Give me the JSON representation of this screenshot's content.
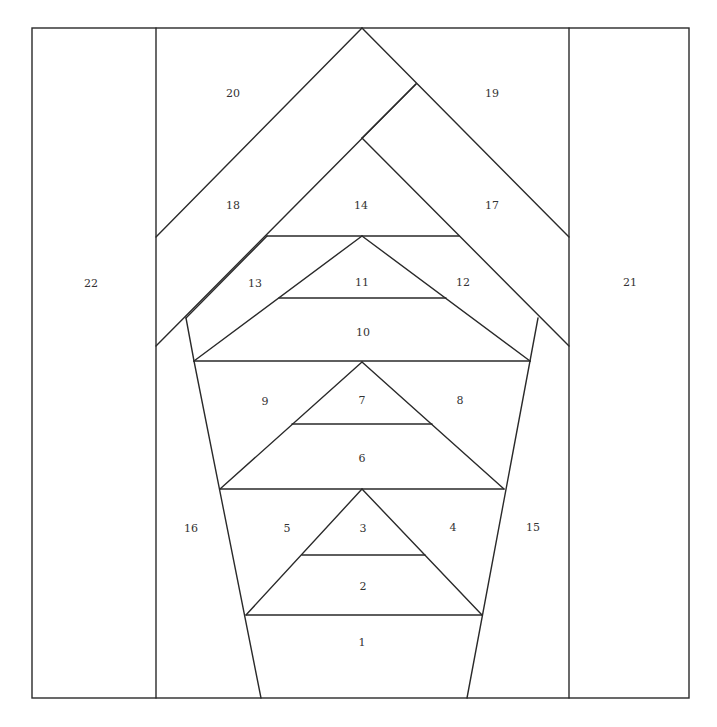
{
  "diagram": {
    "line_color": "#2a2a2a",
    "background": "#ffffff",
    "outer_border": {
      "x1": 32,
      "y1": 28,
      "x2": 689,
      "y2": 698
    },
    "segments": [
      [
        156,
        28,
        156,
        698
      ],
      [
        569,
        28,
        569,
        698
      ],
      [
        156,
        237,
        362,
        28
      ],
      [
        362,
        28,
        569,
        237
      ],
      [
        156,
        346,
        416,
        84
      ],
      [
        416,
        84,
        362,
        138
      ],
      [
        362,
        138,
        569,
        346
      ],
      [
        267,
        236,
        459,
        236
      ],
      [
        186,
        318,
        267,
        236
      ],
      [
        362,
        236,
        530,
        361
      ],
      [
        362,
        236,
        194,
        361
      ],
      [
        279,
        298,
        446,
        298
      ],
      [
        194,
        361,
        530,
        361
      ],
      [
        538,
        318,
        530,
        361
      ],
      [
        186,
        318,
        194,
        361
      ],
      [
        362,
        362,
        220,
        489
      ],
      [
        362,
        362,
        504,
        489
      ],
      [
        292,
        424,
        432,
        424
      ],
      [
        220,
        489,
        504,
        489
      ],
      [
        194,
        361,
        261,
        698
      ],
      [
        530,
        361,
        467,
        698
      ],
      [
        362,
        489,
        246,
        615
      ],
      [
        362,
        489,
        482,
        615
      ],
      [
        302,
        555,
        425,
        555
      ],
      [
        246,
        615,
        482,
        615
      ]
    ],
    "labels": [
      {
        "id": "1",
        "x": 362,
        "y": 643
      },
      {
        "id": "2",
        "x": 363,
        "y": 587
      },
      {
        "id": "3",
        "x": 363,
        "y": 529
      },
      {
        "id": "4",
        "x": 453,
        "y": 528
      },
      {
        "id": "5",
        "x": 287,
        "y": 529
      },
      {
        "id": "6",
        "x": 362,
        "y": 459
      },
      {
        "id": "7",
        "x": 362,
        "y": 401
      },
      {
        "id": "8",
        "x": 460,
        "y": 401
      },
      {
        "id": "9",
        "x": 265,
        "y": 402
      },
      {
        "id": "10",
        "x": 363,
        "y": 333
      },
      {
        "id": "11",
        "x": 362,
        "y": 283
      },
      {
        "id": "12",
        "x": 463,
        "y": 283
      },
      {
        "id": "13",
        "x": 255,
        "y": 284
      },
      {
        "id": "14",
        "x": 361,
        "y": 206
      },
      {
        "id": "15",
        "x": 533,
        "y": 528
      },
      {
        "id": "16",
        "x": 191,
        "y": 529
      },
      {
        "id": "17",
        "x": 492,
        "y": 206
      },
      {
        "id": "18",
        "x": 233,
        "y": 206
      },
      {
        "id": "19",
        "x": 492,
        "y": 94
      },
      {
        "id": "20",
        "x": 233,
        "y": 94
      },
      {
        "id": "21",
        "x": 630,
        "y": 283
      },
      {
        "id": "22",
        "x": 91,
        "y": 284
      }
    ]
  }
}
